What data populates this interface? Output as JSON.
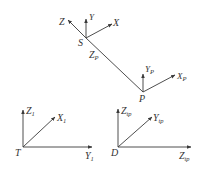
{
  "diagram": {
    "title": "",
    "line_color": "#3a3a3a",
    "frames": [
      {
        "name": "S",
        "origin_label": "S",
        "axes": [
          {
            "label": "Z",
            "sub": ""
          },
          {
            "label": "Y",
            "sub": ""
          },
          {
            "label": "X",
            "sub": ""
          }
        ]
      },
      {
        "name": "P",
        "origin_label": "P",
        "axes": [
          {
            "label": "Y",
            "sub": "P"
          },
          {
            "label": "X",
            "sub": "P"
          }
        ]
      },
      {
        "name": "T",
        "origin_label": "T",
        "axes": [
          {
            "label": "Z",
            "sub": "1"
          },
          {
            "label": "X",
            "sub": "1"
          },
          {
            "label": "Y",
            "sub": "1"
          }
        ]
      },
      {
        "name": "D",
        "origin_label": "D",
        "axes": [
          {
            "label": "Z",
            "sub": "tp"
          },
          {
            "label": "Y",
            "sub": "tp"
          },
          {
            "label": "Z",
            "sub": "tp"
          }
        ]
      }
    ],
    "link_label": {
      "label": "Z",
      "sub": "P"
    }
  }
}
